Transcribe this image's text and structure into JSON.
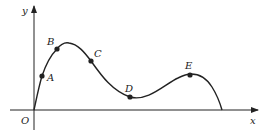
{
  "diagram": {
    "type": "function-graph",
    "axes": {
      "x_label": "x",
      "y_label": "y",
      "origin_label": "O"
    },
    "points": [
      {
        "label": "A",
        "x": 42,
        "y": 76
      },
      {
        "label": "B",
        "x": 57,
        "y": 49
      },
      {
        "label": "C",
        "x": 91,
        "y": 61
      },
      {
        "label": "D",
        "x": 130,
        "y": 97
      },
      {
        "label": "E",
        "x": 190,
        "y": 75
      }
    ],
    "colors": {
      "stroke": "#222222",
      "background": "#ffffff"
    }
  }
}
